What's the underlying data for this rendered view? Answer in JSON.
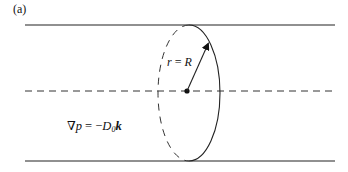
{
  "figure": {
    "panel_label": "(a)",
    "radius_label": {
      "var_left": "r",
      "op": " = ",
      "var_right": "R"
    },
    "pressure_gradient": {
      "nabla": "∇",
      "var": "p",
      "op": " = −",
      "coef": "D",
      "coef_sub": "0",
      "vector": "k"
    },
    "elements": {
      "pipe_walls": "solid-lines",
      "axis": "dashed-centerline",
      "cross_section": "ellipse-front-solid-back-dashed",
      "radius_arrow": "center-to-rim"
    },
    "colors": {
      "stroke": "#222222",
      "background": "#ffffff"
    }
  }
}
